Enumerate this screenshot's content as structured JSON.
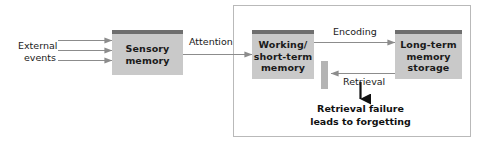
{
  "diagram": {
    "boxes": {
      "sensory": {
        "lines": [
          "Sensory",
          "memory"
        ]
      },
      "working": {
        "lines": [
          "Working/",
          "short-term",
          "memory"
        ]
      },
      "longterm": {
        "lines": [
          "Long-term",
          "memory",
          "storage"
        ]
      }
    },
    "labels": {
      "external_events": {
        "lines": [
          "External",
          "events"
        ]
      },
      "attention": "Attention",
      "encoding": "Encoding",
      "retrieval": "Retrieval",
      "retrieval_failure": {
        "lines": [
          "Retrieval failure",
          "leads to forgetting"
        ]
      }
    },
    "colors": {
      "box_fill": "#c9c9c9",
      "box_top_bar": "#6e6e6e",
      "arrow": "#8c8c8c",
      "blocker": "#b4b4b4",
      "panel_border": "#b9b9b9",
      "text": "#1a1a1a",
      "bold_arrow": "#111111",
      "background": "#ffffff"
    }
  }
}
